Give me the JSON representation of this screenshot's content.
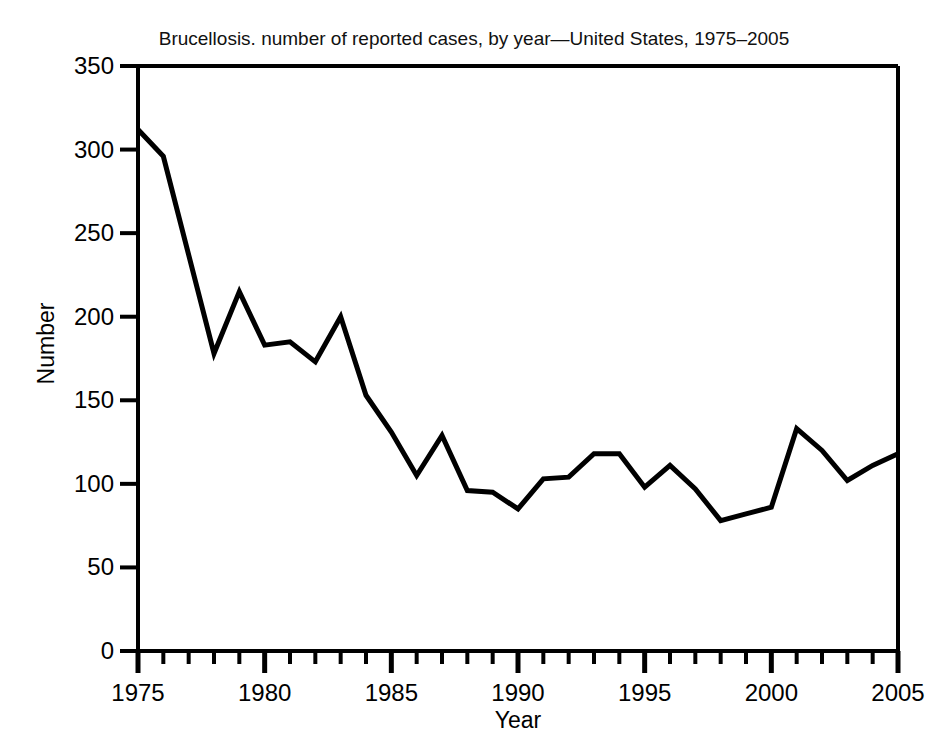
{
  "chart_data": {
    "type": "line",
    "title": "Brucellosis. number of reported cases, by year—United States, 1975–2005",
    "xlabel": "Year",
    "ylabel": "Number",
    "xlim": [
      1975,
      2005
    ],
    "ylim": [
      0,
      350
    ],
    "grid": false,
    "legend": null,
    "x_major_ticks": [
      1975,
      1980,
      1985,
      1990,
      1995,
      2000,
      2005
    ],
    "x_minor_tick_step": 1,
    "y_ticks": [
      0,
      50,
      100,
      150,
      200,
      250,
      300,
      350
    ],
    "x_tick_labels": [
      "1975",
      "1980",
      "1985",
      "1990",
      "1995",
      "2000",
      "2005"
    ],
    "y_tick_labels": [
      "0",
      "50",
      "100",
      "150",
      "200",
      "250",
      "300",
      "350"
    ],
    "series": [
      {
        "name": "Reported cases",
        "color": "#000000",
        "line_width": 5,
        "x": [
          1975,
          1976,
          1977,
          1978,
          1979,
          1980,
          1981,
          1982,
          1983,
          1984,
          1985,
          1986,
          1987,
          1988,
          1989,
          1990,
          1991,
          1992,
          1993,
          1994,
          1995,
          1996,
          1997,
          1998,
          1999,
          2000,
          2001,
          2002,
          2003,
          2004,
          2005
        ],
        "values": [
          312,
          296,
          237,
          178,
          215,
          183,
          185,
          173,
          200,
          153,
          131,
          105,
          129,
          96,
          95,
          85,
          103,
          104,
          118,
          118,
          98,
          111,
          97,
          78,
          82,
          86,
          133,
          120,
          102,
          111,
          118
        ]
      }
    ]
  }
}
